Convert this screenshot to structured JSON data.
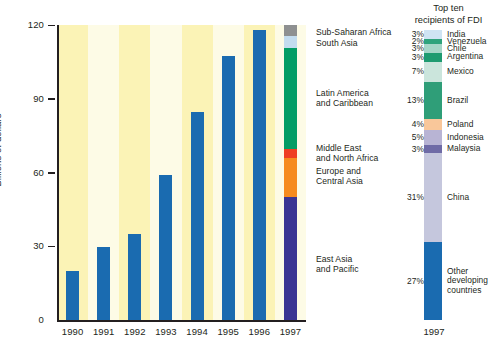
{
  "chart_data": {
    "type": "bar",
    "title": "",
    "xlabel": "",
    "ylabel": "Billions of dollars",
    "ylim": [
      0,
      120
    ],
    "yticks": [
      0,
      30,
      60,
      90,
      120
    ],
    "ytick_labels": [
      "0",
      "30",
      "60",
      "90",
      "120"
    ],
    "grid": false,
    "legend_position": "right-of-stacked-bar",
    "categories": [
      "1990",
      "1991",
      "1992",
      "1993",
      "1994",
      "1995",
      "1996",
      "1997"
    ],
    "values": [
      20,
      29.5,
      35,
      59,
      84.5,
      107.5,
      118,
      120
    ],
    "bar_color": "#1a6bb0",
    "series": [
      {
        "name": "Net FDI flows to developing countries",
        "values": [
          20,
          29.5,
          35,
          59,
          84.5,
          107.5,
          118,
          120
        ]
      }
    ],
    "stacked_1997_regions": {
      "total": 120,
      "note": "The 1997 bar is broken out by region",
      "segments": [
        {
          "label": "Sub-Saharan Africa",
          "value": 4.5,
          "color": "#8e9091"
        },
        {
          "label": "South Asia",
          "value": 5.0,
          "color": "#c3dcef"
        },
        {
          "label": "Latin America\nand Caribbean",
          "value": 41.0,
          "color": "#039d65"
        },
        {
          "label": "Middle East\nand North Africa",
          "value": 3.5,
          "color": "#ef3e23"
        },
        {
          "label": "Europe and\nCentral Asia",
          "value": 16.0,
          "color": "#f68b1f"
        },
        {
          "label": "East Asia\nand Pacific",
          "value": 50.0,
          "color": "#3b3593"
        }
      ]
    },
    "top_ten_recipients": {
      "title": "Top ten\nrecipients of FDI",
      "xlabel": "1997",
      "unit": "percent of total FDI to developing countries",
      "segments": [
        {
          "label": "India",
          "percent": "3%",
          "value": 3,
          "color": "#cfe4f3"
        },
        {
          "label": "Venezuela",
          "percent": "2%",
          "value": 2,
          "color": "#2fa37c"
        },
        {
          "label": "Chile",
          "percent": "3%",
          "value": 3,
          "color": "#a7d6c8"
        },
        {
          "label": "Argentina",
          "percent": "3%",
          "value": 3,
          "color": "#1f9b70"
        },
        {
          "label": "Mexico",
          "percent": "7%",
          "value": 7,
          "color": "#cbe5dc"
        },
        {
          "label": "Brazil",
          "percent": "13%",
          "value": 13,
          "color": "#2f9e78"
        },
        {
          "label": "Poland",
          "percent": "4%",
          "value": 4,
          "color": "#f9c79a"
        },
        {
          "label": "Indonesia",
          "percent": "5%",
          "value": 5,
          "color": "#b8b4d4"
        },
        {
          "label": "Malaysia",
          "percent": "3%",
          "value": 3,
          "color": "#6f6ba6"
        },
        {
          "label": "China",
          "percent": "31%",
          "value": 31,
          "color": "#c5c7dd"
        },
        {
          "label": "Other\ndeveloping\ncountries",
          "percent": "27%",
          "value": 27,
          "color": "#1a6bb0"
        }
      ]
    },
    "background_bands": [
      "#fbf3b6",
      "#fdfbe6"
    ]
  },
  "axis": {
    "y_label": "Billions of dollars",
    "y_ticks": [
      "120",
      "90",
      "60",
      "30",
      "0"
    ],
    "x_ticks": [
      "1990",
      "1991",
      "1992",
      "1993",
      "1994",
      "1995",
      "1996",
      "1997"
    ]
  },
  "region_legend": [
    {
      "label": "Sub-Saharan Africa"
    },
    {
      "label": "South Asia"
    },
    {
      "label": "Latin America\nand Caribbean"
    },
    {
      "label": "Middle East\nand North Africa"
    },
    {
      "label": "Europe and\nCentral Asia"
    },
    {
      "label": "East Asia\nand Pacific"
    }
  ],
  "right_panel": {
    "title": "Top ten\nrecipients of FDI",
    "year": "1997"
  }
}
